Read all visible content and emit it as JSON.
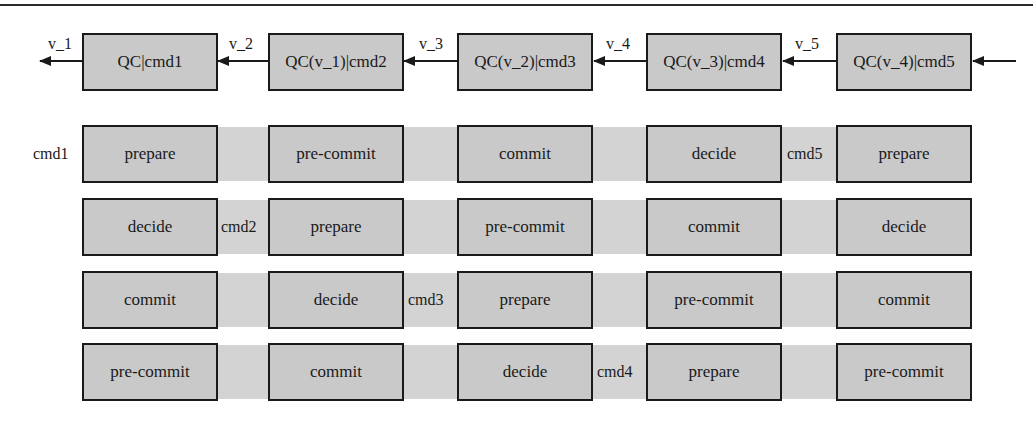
{
  "diagram": {
    "colors": {
      "box_fill": "#c9c9c9",
      "box_border": "#1a1a1a",
      "row_band": "#d3d3d3",
      "arrow": "#1a1a1a"
    },
    "chain": {
      "direction": "right-to-left",
      "nodes": [
        {
          "label": "QC|cmd1"
        },
        {
          "label": "QC(v_1)|cmd2"
        },
        {
          "label": "QC(v_2)|cmd3"
        },
        {
          "label": "QC(v_3)|cmd4"
        },
        {
          "label": "QC(v_4)|cmd5"
        }
      ],
      "edges": [
        {
          "label": "v_1",
          "from": "QC|cmd1",
          "to": "out"
        },
        {
          "label": "v_2",
          "from": "QC(v_1)|cmd2",
          "to": "QC|cmd1"
        },
        {
          "label": "v_3",
          "from": "QC(v_2)|cmd3",
          "to": "QC(v_1)|cmd2"
        },
        {
          "label": "v_4",
          "from": "QC(v_3)|cmd4",
          "to": "QC(v_2)|cmd3"
        },
        {
          "label": "v_5",
          "from": "QC(v_4)|cmd5",
          "to": "QC(v_3)|cmd4"
        },
        {
          "label": "",
          "from": "in",
          "to": "QC(v_4)|cmd5"
        }
      ]
    },
    "pipeline": {
      "rows": [
        {
          "cells": [
            "prepare",
            "pre-commit",
            "commit",
            "decide",
            "prepare"
          ],
          "cmd_labels": [
            {
              "text": "cmd1",
              "before_col": 0
            },
            {
              "text": "cmd5",
              "before_col": 4
            }
          ]
        },
        {
          "cells": [
            "decide",
            "prepare",
            "pre-commit",
            "commit",
            "decide"
          ],
          "cmd_labels": [
            {
              "text": "cmd2",
              "before_col": 1
            }
          ]
        },
        {
          "cells": [
            "commit",
            "decide",
            "prepare",
            "pre-commit",
            "commit"
          ],
          "cmd_labels": [
            {
              "text": "cmd3",
              "before_col": 2
            }
          ]
        },
        {
          "cells": [
            "pre-commit",
            "commit",
            "decide",
            "prepare",
            "pre-commit"
          ],
          "cmd_labels": [
            {
              "text": "cmd4",
              "before_col": 3
            }
          ]
        }
      ]
    }
  }
}
